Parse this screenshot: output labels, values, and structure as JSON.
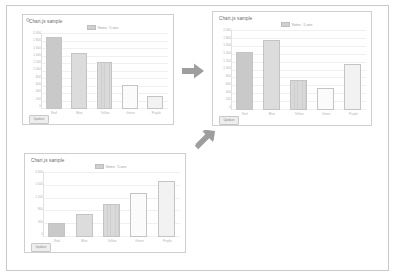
{
  "document": {
    "frame_label": "slide-frame"
  },
  "panels": [
    {
      "id": "panel-initial",
      "title": "Chart.js sample",
      "legend_label": "Votes : 5 ans",
      "button_label": "Update",
      "y_ticks": [
        "2 000",
        "1 800",
        "1 600",
        "1 400",
        "1 200",
        "1 000",
        "800",
        "600",
        "400",
        "200",
        "0"
      ],
      "x_labels": [
        "Red",
        "Blue",
        "Yellow",
        "Green",
        "Purple"
      ]
    },
    {
      "id": "panel-sorted-mixed",
      "title": "Chart.js sample",
      "legend_label": "Votes : 5 ans",
      "button_label": "Update",
      "y_ticks": [
        "2 000",
        "1 800",
        "1 600",
        "1 400",
        "1 200",
        "1 000",
        "800",
        "600",
        "400",
        "200",
        "0"
      ],
      "x_labels": [
        "Red",
        "Blue",
        "Yellow",
        "Green",
        "Purple"
      ]
    },
    {
      "id": "panel-ascending",
      "title": "Chart.js sample",
      "legend_label": "Votes : 5 ans",
      "button_label": "Update",
      "y_ticks": [
        "2 000",
        "1 600",
        "1 200",
        "800",
        "400",
        "0"
      ],
      "x_labels": [
        "Red",
        "Blue",
        "Yellow",
        "Green",
        "Purple"
      ]
    }
  ],
  "arrows": [
    {
      "name": "arrow-right",
      "direction": "right"
    },
    {
      "name": "arrow-down-left",
      "direction": "down-left"
    }
  ],
  "colors": {
    "bar_dark": "#c9c9c9",
    "bar_mid": "#dcdcdc",
    "bar_hatch": "#d9d9d9",
    "bar_light": "#fbfbfb",
    "bar_pale": "#f2f2f2",
    "border": "#c4c4c4",
    "arrow": "#9e9e9e",
    "panel_border": "#cfcfcf",
    "frame_border": "#c9c9c9"
  },
  "chart_data": [
    {
      "type": "bar",
      "title": "Chart.js sample",
      "panel": "panel-initial",
      "categories": [
        "Red",
        "Blue",
        "Yellow",
        "Green",
        "Purple"
      ],
      "values": [
        1900,
        1480,
        1230,
        620,
        330
      ],
      "series": [
        {
          "name": "Votes : 5 ans",
          "values": [
            1900,
            1480,
            1230,
            620,
            330
          ]
        }
      ],
      "xlabel": "",
      "ylabel": "",
      "ylim": [
        0,
        2000
      ],
      "grid": true,
      "legend": "top-center"
    },
    {
      "type": "bar",
      "title": "Chart.js sample",
      "panel": "panel-sorted-mixed",
      "categories": [
        "Red",
        "Blue",
        "Yellow",
        "Green",
        "Purple"
      ],
      "values": [
        1460,
        1760,
        760,
        560,
        1160
      ],
      "series": [
        {
          "name": "Votes : 5 ans",
          "values": [
            1460,
            1760,
            760,
            560,
            1160
          ]
        }
      ],
      "xlabel": "",
      "ylabel": "",
      "ylim": [
        0,
        2000
      ],
      "grid": true,
      "legend": "top-center"
    },
    {
      "type": "bar",
      "title": "Chart.js sample",
      "panel": "panel-ascending",
      "categories": [
        "Red",
        "Blue",
        "Yellow",
        "Green",
        "Purple"
      ],
      "values": [
        420,
        720,
        1020,
        1340,
        1720
      ],
      "series": [
        {
          "name": "Votes : 5 ans",
          "values": [
            420,
            720,
            1020,
            1340,
            1720
          ]
        }
      ],
      "xlabel": "",
      "ylabel": "",
      "ylim": [
        0,
        2000
      ],
      "grid": true,
      "legend": "top-center"
    }
  ]
}
